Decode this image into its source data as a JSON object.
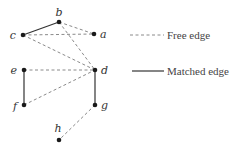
{
  "diagram": {
    "title": "",
    "colors": {
      "node": "#1a1a1a",
      "matched_edge": "#333333",
      "free_edge": "#8a8a8a",
      "label": "#333333"
    },
    "nodes": [
      {
        "id": "a",
        "label": "a",
        "x": 94,
        "y": 34,
        "lx": 100,
        "ly": 38,
        "anchor": "start"
      },
      {
        "id": "b",
        "label": "b",
        "x": 59,
        "y": 22,
        "lx": 59,
        "ly": 16,
        "anchor": "middle"
      },
      {
        "id": "c",
        "label": "c",
        "x": 23,
        "y": 35,
        "lx": 16,
        "ly": 39,
        "anchor": "end"
      },
      {
        "id": "d",
        "label": "d",
        "x": 95,
        "y": 70,
        "lx": 101,
        "ly": 74,
        "anchor": "start"
      },
      {
        "id": "e",
        "label": "e",
        "x": 24,
        "y": 70,
        "lx": 17,
        "ly": 74,
        "anchor": "end"
      },
      {
        "id": "f",
        "label": "f",
        "x": 24,
        "y": 105,
        "lx": 17,
        "ly": 110,
        "anchor": "end"
      },
      {
        "id": "g",
        "label": "g",
        "x": 95,
        "y": 105,
        "lx": 101,
        "ly": 109,
        "anchor": "start"
      },
      {
        "id": "h",
        "label": "h",
        "x": 59,
        "y": 140,
        "lx": 58,
        "ly": 132,
        "anchor": "middle"
      }
    ],
    "edges": [
      {
        "from": "c",
        "to": "b",
        "type": "matched"
      },
      {
        "from": "e",
        "to": "f",
        "type": "matched"
      },
      {
        "from": "d",
        "to": "g",
        "type": "matched"
      },
      {
        "from": "b",
        "to": "a",
        "type": "free"
      },
      {
        "from": "c",
        "to": "a",
        "type": "free"
      },
      {
        "from": "b",
        "to": "d",
        "type": "free"
      },
      {
        "from": "c",
        "to": "d",
        "type": "free"
      },
      {
        "from": "e",
        "to": "d",
        "type": "free"
      },
      {
        "from": "f",
        "to": "d",
        "type": "free"
      },
      {
        "from": "g",
        "to": "h",
        "type": "free"
      }
    ],
    "legend": [
      {
        "type": "free",
        "label": "Free edge",
        "x1": 130,
        "x2": 164,
        "y": 35,
        "tx": 167,
        "ty": 39
      },
      {
        "type": "matched",
        "label": "Matched edge",
        "x1": 132,
        "x2": 164,
        "y": 71,
        "tx": 167,
        "ty": 75
      }
    ]
  }
}
